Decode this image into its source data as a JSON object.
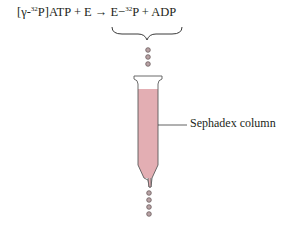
{
  "equation": {
    "reactant1_prefix": "[γ-",
    "reactant1_sup": "32",
    "reactant1_suffix": "P]ATP",
    "plus1": " + ",
    "reactant2": "E",
    "arrow": " → ",
    "product1_prefix": "E−",
    "product1_sup": "32",
    "product1_suffix": "P",
    "plus2": " + ",
    "product2": "ADP"
  },
  "column_label": "Sephadex column",
  "colors": {
    "column_fill": "#e3aeb3",
    "drop_fill": "#b8a2a4",
    "stroke": "#5a5a5a"
  }
}
